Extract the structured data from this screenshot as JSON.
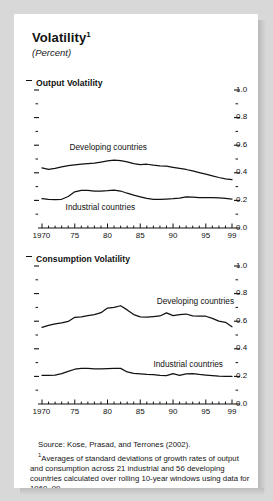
{
  "figure": {
    "title": "Volatility",
    "title_superscript": "1",
    "subtitle": "(Percent)"
  },
  "notes": {
    "source": "Source: Kose, Prasad, and Terrones (2002).",
    "footnote_marker": "1",
    "footnote": "Averages of standard deviations of growth rates of output and consumption across 21 industrial and 56 developing countries calculated over rolling 10-year windows using data for 1960–99."
  },
  "chart_data": [
    {
      "type": "line",
      "title": "Output Volatility",
      "xlabel": "",
      "ylabel": "",
      "xlim": [
        1970,
        1999
      ],
      "ylim": [
        0.0,
        1.0
      ],
      "ytick_labels": [
        "1.0",
        "0.8",
        "0.6",
        "0.4",
        "0.2",
        "0.0"
      ],
      "ytick_values": [
        1.0,
        0.8,
        0.6,
        0.4,
        0.2,
        0.0
      ],
      "yminor_values": [
        0.9,
        0.7,
        0.5,
        0.3,
        0.1
      ],
      "xtick_labels": [
        "1970",
        "75",
        "80",
        "85",
        "90",
        "95",
        "99"
      ],
      "xtick_values": [
        1970,
        1975,
        1980,
        1985,
        1990,
        1995,
        1999
      ],
      "grid": false,
      "legend_position": "inline-annotations",
      "x": [
        1970,
        1971,
        1972,
        1973,
        1974,
        1975,
        1976,
        1977,
        1978,
        1979,
        1980,
        1981,
        1982,
        1983,
        1984,
        1985,
        1986,
        1987,
        1988,
        1989,
        1990,
        1991,
        1992,
        1993,
        1994,
        1995,
        1996,
        1997,
        1998,
        1999
      ],
      "series": [
        {
          "name": "Developing countries",
          "label_x": 1974.2,
          "label_y": 0.585,
          "values": [
            0.435,
            0.425,
            0.432,
            0.443,
            0.452,
            0.458,
            0.462,
            0.466,
            0.47,
            0.478,
            0.486,
            0.492,
            0.489,
            0.479,
            0.466,
            0.46,
            0.462,
            0.455,
            0.45,
            0.448,
            0.44,
            0.432,
            0.424,
            0.414,
            0.402,
            0.39,
            0.378,
            0.366,
            0.356,
            0.35
          ]
        },
        {
          "name": "Industrial countries",
          "label_x": 1973.6,
          "label_y": 0.152,
          "values": [
            0.212,
            0.208,
            0.206,
            0.208,
            0.228,
            0.262,
            0.272,
            0.272,
            0.268,
            0.268,
            0.27,
            0.274,
            0.268,
            0.252,
            0.238,
            0.226,
            0.214,
            0.208,
            0.208,
            0.21,
            0.212,
            0.216,
            0.226,
            0.224,
            0.22,
            0.22,
            0.22,
            0.218,
            0.214,
            0.21
          ]
        }
      ]
    },
    {
      "type": "line",
      "title": "Consumption Volatility",
      "xlabel": "",
      "ylabel": "",
      "xlim": [
        1970,
        1999
      ],
      "ylim": [
        0.0,
        1.0
      ],
      "ytick_labels": [
        "1.0",
        "0.8",
        "0.6",
        "0.4",
        "0.2",
        "0.0"
      ],
      "ytick_values": [
        1.0,
        0.8,
        0.6,
        0.4,
        0.2,
        0.0
      ],
      "yminor_values": [
        0.9,
        0.7,
        0.5,
        0.3,
        0.1
      ],
      "xtick_labels": [
        "1970",
        "75",
        "80",
        "85",
        "90",
        "95",
        "99"
      ],
      "xtick_values": [
        1970,
        1975,
        1980,
        1985,
        1990,
        1995,
        1999
      ],
      "grid": false,
      "legend_position": "inline-annotations",
      "x": [
        1970,
        1971,
        1972,
        1973,
        1974,
        1975,
        1976,
        1977,
        1978,
        1979,
        1980,
        1981,
        1982,
        1983,
        1984,
        1985,
        1986,
        1987,
        1988,
        1989,
        1990,
        1991,
        1992,
        1993,
        1994,
        1995,
        1996,
        1997,
        1998,
        1999
      ],
      "series": [
        {
          "name": "Developing countries",
          "label_x": 1987.5,
          "label_y": 0.745,
          "values": [
            0.555,
            0.57,
            0.58,
            0.588,
            0.598,
            0.628,
            0.632,
            0.64,
            0.648,
            0.662,
            0.695,
            0.7,
            0.712,
            0.682,
            0.648,
            0.632,
            0.63,
            0.634,
            0.638,
            0.66,
            0.64,
            0.648,
            0.652,
            0.638,
            0.636,
            0.636,
            0.62,
            0.6,
            0.592,
            0.56
          ]
        },
        {
          "name": "Industrial countries",
          "label_x": 1987.0,
          "label_y": 0.288,
          "values": [
            0.208,
            0.207,
            0.21,
            0.22,
            0.236,
            0.252,
            0.258,
            0.258,
            0.255,
            0.254,
            0.256,
            0.258,
            0.258,
            0.232,
            0.222,
            0.218,
            0.214,
            0.212,
            0.208,
            0.206,
            0.22,
            0.208,
            0.218,
            0.22,
            0.214,
            0.21,
            0.206,
            0.202,
            0.2,
            0.2
          ]
        }
      ]
    }
  ]
}
